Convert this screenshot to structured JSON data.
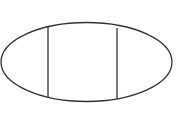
{
  "diagram": {
    "background": "#ffffff",
    "stroke_color": "#333333",
    "stroke_width": 1.3,
    "ellipse": {
      "cx": 86.5,
      "cy": 62,
      "rx": 85.5,
      "ry": 39.5
    },
    "dividers": [
      {
        "x1": 48,
        "y1": 27,
        "x2": 48,
        "y2": 97
      },
      {
        "x1": 117,
        "y1": 28,
        "x2": 117,
        "y2": 99
      }
    ],
    "regions": [
      "left",
      "middle",
      "right"
    ]
  }
}
